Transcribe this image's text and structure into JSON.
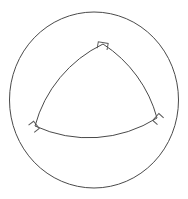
{
  "figure": {
    "background_color": "#ffffff",
    "stroke_color": "#4a4a4a",
    "marker_stroke_color": "#5a5a5a",
    "stroke_width": 1,
    "canvas": {
      "width": 188,
      "height": 199
    }
  },
  "chart_data": {
    "type": "diagram",
    "xlabel": "",
    "ylabel": "",
    "shapes": [
      {
        "name": "outer-circle",
        "kind": "circle",
        "center": [
          94,
          100
        ],
        "radius": 84,
        "stroke": "#4a4a4a",
        "fill": "none"
      },
      {
        "name": "curved-triangle",
        "kind": "reuleaux-triangle",
        "vertices": [
          {
            "label": "top",
            "x": 103,
            "y": 44
          },
          {
            "label": "bottom-right",
            "x": 157,
            "y": 118
          },
          {
            "label": "bottom-left",
            "x": 35,
            "y": 126
          }
        ],
        "arc_radius": 128,
        "stroke": "#4a4a4a",
        "fill": "none"
      }
    ],
    "annotations": [
      {
        "name": "right-angle-top",
        "type": "right-angle-marker",
        "at": [
          103,
          44
        ],
        "size": 7,
        "rotation_deg": 10
      },
      {
        "name": "right-angle-bottom-right",
        "type": "right-angle-marker",
        "at": [
          157,
          118
        ],
        "size": 7,
        "rotation_deg": -48
      },
      {
        "name": "right-angle-bottom-left",
        "type": "right-angle-marker",
        "at": [
          35,
          126
        ],
        "size": 7,
        "rotation_deg": 52
      }
    ],
    "legend": [],
    "grid": false
  }
}
